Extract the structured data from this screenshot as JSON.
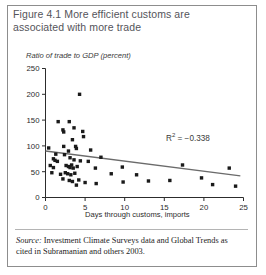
{
  "figure": {
    "title": "Figure 4.1  More efficient customs are associated with more trade",
    "source_label": "Source:",
    "source_text": " Investment Climate Surveys data and Global Trends as cited in Subramanian and others 2003."
  },
  "annotation": {
    "r2_prefix": "R",
    "r2_exponent": "2",
    "r2_value": " =  −0.338"
  },
  "colors": {
    "border": "#8d8d8d",
    "title_text": "#54545a",
    "axis": "#2c2c2c",
    "marker": "#1a1a1a",
    "trendline": "#6b6b6b",
    "background": "#ffffff"
  },
  "chart_data": {
    "type": "scatter",
    "title": "Figure 4.1  More efficient customs are associated with more trade",
    "xlabel": "Days through customs, imports",
    "ylabel": "Ratio of trade to GDP (percent)",
    "xlim": [
      0,
      25
    ],
    "ylim": [
      0,
      250
    ],
    "xticks": [
      0,
      5,
      10,
      15,
      20,
      25
    ],
    "yticks": [
      0,
      50,
      100,
      150,
      200,
      250
    ],
    "xtick_labels": [
      "0",
      "5",
      "10",
      "15",
      "20",
      "25"
    ],
    "ytick_labels": [
      "0",
      "50",
      "100",
      "150",
      "200",
      "250"
    ],
    "grid": false,
    "legend": null,
    "annotations": [
      {
        "text": "R² =  −0.338",
        "x": 15.0,
        "y": 120
      }
    ],
    "series": [
      {
        "name": "Countries",
        "marker": "square",
        "points": [
          [
            4.3,
            200
          ],
          [
            1.6,
            147
          ],
          [
            3.0,
            147
          ],
          [
            2.2,
            131
          ],
          [
            2.3,
            127
          ],
          [
            3.6,
            135
          ],
          [
            4.7,
            128
          ],
          [
            4.8,
            118
          ],
          [
            3.4,
            112
          ],
          [
            0.4,
            96
          ],
          [
            2.3,
            99
          ],
          [
            3.8,
            99
          ],
          [
            3.9,
            95
          ],
          [
            2.9,
            90
          ],
          [
            5.7,
            92
          ],
          [
            1.3,
            84
          ],
          [
            2.4,
            83
          ],
          [
            1.0,
            75
          ],
          [
            1.2,
            72
          ],
          [
            1.5,
            70
          ],
          [
            3.1,
            77
          ],
          [
            3.6,
            73
          ],
          [
            4.4,
            71
          ],
          [
            5.4,
            70
          ],
          [
            7.0,
            78
          ],
          [
            0.6,
            62
          ],
          [
            1.0,
            58
          ],
          [
            2.6,
            62
          ],
          [
            2.9,
            60
          ],
          [
            3.1,
            58
          ],
          [
            3.3,
            63
          ],
          [
            3.5,
            57
          ],
          [
            4.0,
            60
          ],
          [
            6.3,
            57
          ],
          [
            9.7,
            59
          ],
          [
            17.3,
            63
          ],
          [
            23.2,
            57
          ],
          [
            0.8,
            48
          ],
          [
            1.9,
            45
          ],
          [
            2.5,
            48
          ],
          [
            2.8,
            46
          ],
          [
            3.2,
            44
          ],
          [
            3.7,
            47
          ],
          [
            2.2,
            36
          ],
          [
            3.0,
            33
          ],
          [
            3.4,
            31
          ],
          [
            4.2,
            34
          ],
          [
            8.3,
            46
          ],
          [
            11.5,
            44
          ],
          [
            19.7,
            38
          ],
          [
            5.0,
            29
          ],
          [
            6.4,
            27
          ],
          [
            9.8,
            30
          ],
          [
            13.0,
            32
          ],
          [
            15.7,
            33
          ],
          [
            21.1,
            25
          ],
          [
            24.0,
            22
          ],
          [
            3.9,
            24
          ]
        ]
      }
    ],
    "trendline": {
      "name": "fit",
      "x0": 0.0,
      "y0": 90,
      "x1": 24.6,
      "y1": 42
    }
  }
}
